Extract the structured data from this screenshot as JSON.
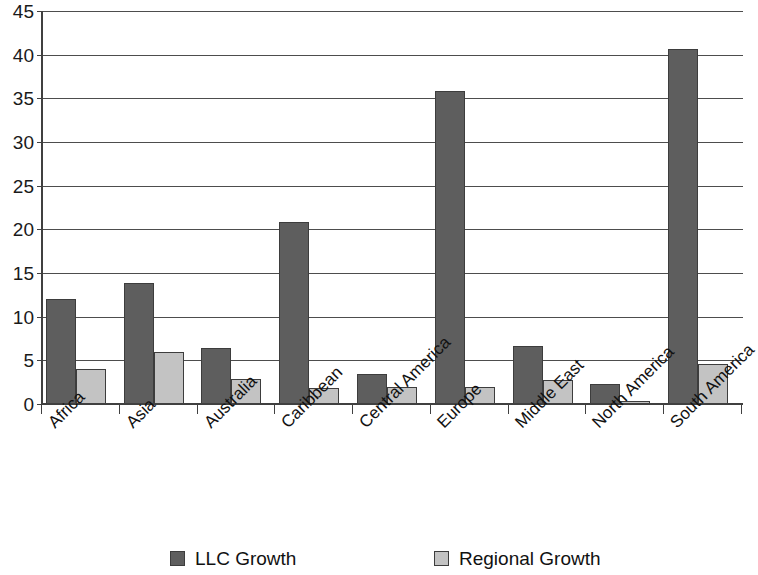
{
  "chart_data": {
    "type": "bar",
    "title": "",
    "subtitle": "",
    "xlabel": "",
    "ylabel": "",
    "ylim": [
      0,
      45
    ],
    "ytick_step": 5,
    "yticks": [
      0,
      5,
      10,
      15,
      20,
      25,
      30,
      35,
      40,
      45
    ],
    "grid": true,
    "grid_axis": "y",
    "legend_position": "bottom",
    "categories": [
      "Africa",
      "Asia",
      "Australia",
      "Caribbean",
      "Central America",
      "Europe",
      "Middle East",
      "North America",
      "South America"
    ],
    "series": [
      {
        "name": "LLC Growth",
        "color": "#5e5e5e",
        "values": [
          12.0,
          13.9,
          6.4,
          20.8,
          3.4,
          35.8,
          6.7,
          2.3,
          40.6
        ]
      },
      {
        "name": "Regional Growth",
        "color": "#c3c3c3",
        "values": [
          4.0,
          5.9,
          2.9,
          1.8,
          1.9,
          1.9,
          2.8,
          0.35,
          4.6
        ]
      }
    ]
  },
  "legend": {
    "entries": [
      {
        "label": "LLC Growth",
        "swatch": "llc"
      },
      {
        "label": "Regional Growth",
        "swatch": "regional"
      }
    ]
  },
  "colors": {
    "llc_growth": "#5e5e5e",
    "regional_growth": "#c3c3c3",
    "axis": "#404040",
    "gridline": "#4d4d4d",
    "background": "#ffffff",
    "text": "#111111"
  }
}
